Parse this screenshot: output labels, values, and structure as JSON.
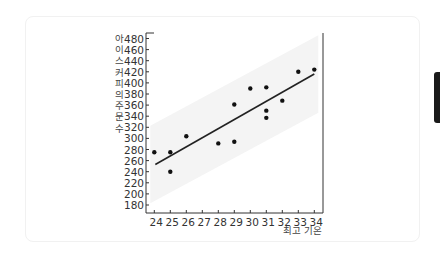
{
  "chart_data": {
    "type": "scatter",
    "title": "",
    "xlabel": "최고 기온",
    "ylabel": "아이스커피의 주문 수",
    "x_ticks": [
      24,
      25,
      26,
      27,
      28,
      29,
      30,
      31,
      32,
      33,
      34
    ],
    "y_ticks": [
      180,
      200,
      220,
      240,
      260,
      280,
      300,
      320,
      340,
      360,
      380,
      400,
      420,
      440,
      460,
      480
    ],
    "xlim": [
      23.5,
      34.5
    ],
    "ylim": [
      170,
      490
    ],
    "grid": false,
    "legend": null,
    "points": [
      {
        "x": 24,
        "y": 275
      },
      {
        "x": 25,
        "y": 275
      },
      {
        "x": 25,
        "y": 240
      },
      {
        "x": 26,
        "y": 304
      },
      {
        "x": 28,
        "y": 291
      },
      {
        "x": 29,
        "y": 361
      },
      {
        "x": 29,
        "y": 294
      },
      {
        "x": 30,
        "y": 390
      },
      {
        "x": 31,
        "y": 392
      },
      {
        "x": 31,
        "y": 350
      },
      {
        "x": 31,
        "y": 337
      },
      {
        "x": 32,
        "y": 368
      },
      {
        "x": 33,
        "y": 420
      },
      {
        "x": 34,
        "y": 424
      }
    ],
    "trend_line": {
      "x0": 24,
      "y0": 253,
      "x1": 34,
      "y1": 416
    },
    "confidence_band": {
      "width": 70
    },
    "colors": {
      "points": "#111111",
      "line": "#222222",
      "axis": "#333333",
      "band": "#f4f4f4"
    }
  }
}
